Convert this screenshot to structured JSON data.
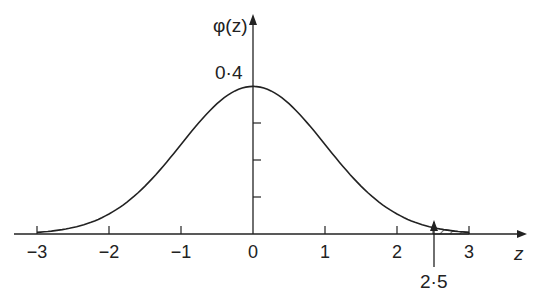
{
  "chart_data": {
    "type": "line",
    "title": "",
    "xlabel": "z",
    "ylabel": "φ(z)",
    "x_ticks": [
      -3,
      -2,
      -1,
      0,
      1,
      2,
      3
    ],
    "x_tick_labels": [
      "−3",
      "−2",
      "−1",
      "0",
      "1",
      "2",
      "3"
    ],
    "y_annotation": "0·4",
    "series": [
      {
        "name": "standard normal density",
        "function": "phi(z)=exp(-z^2/2)/sqrt(2π)",
        "x_range": [
          -3,
          3
        ]
      }
    ],
    "shaded_region": {
      "from": 2.5,
      "to": 3,
      "pattern": "hatched"
    },
    "annotations": [
      {
        "label": "2·5",
        "x": 2.5,
        "type": "arrow"
      }
    ],
    "xlim": [
      -3.3,
      3.6
    ],
    "ylim": [
      0,
      0.45
    ],
    "grid": false,
    "legend": false
  },
  "labels": {
    "ylabel": "φ(z)",
    "xlabel": "z",
    "y_value": "0·4",
    "arrow_label": "2·5"
  }
}
